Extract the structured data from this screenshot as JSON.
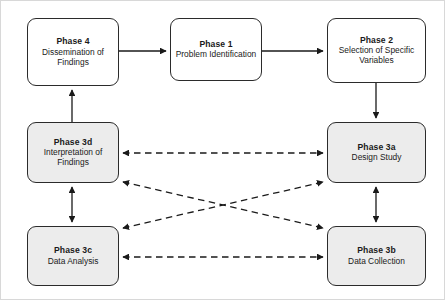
{
  "diagram": {
    "colors": {
      "plain_fill": "#ffffff",
      "shaded_fill": "#ececec",
      "stroke": "#2b2b2b",
      "frame": "#d8d8d8",
      "text": "#1a1a1a"
    },
    "nodes": [
      {
        "id": "phase4",
        "title": "Phase 4",
        "desc": "Dissemination of Findings",
        "style": "plain",
        "x": 27,
        "y": 18,
        "w": 92,
        "h": 68
      },
      {
        "id": "phase1",
        "title": "Phase 1",
        "desc": "Problem Identification",
        "style": "plain",
        "x": 170,
        "y": 18,
        "w": 92,
        "h": 63
      },
      {
        "id": "phase2",
        "title": "Phase 2",
        "desc": "Selection of Specific Variables",
        "style": "plain",
        "x": 327,
        "y": 18,
        "w": 99,
        "h": 65
      },
      {
        "id": "phase3d",
        "title": "Phase 3d",
        "desc": "Interpretation of Findings",
        "style": "shaded",
        "x": 27,
        "y": 122,
        "w": 92,
        "h": 61
      },
      {
        "id": "phase3a",
        "title": "Phase 3a",
        "desc": "Design Study",
        "style": "shaded",
        "x": 327,
        "y": 122,
        "w": 99,
        "h": 61
      },
      {
        "id": "phase3c",
        "title": "Phase 3c",
        "desc": "Data Analysis",
        "style": "shaded",
        "x": 27,
        "y": 226,
        "w": 92,
        "h": 60
      },
      {
        "id": "phase3b",
        "title": "Phase 3b",
        "desc": "Data Collection",
        "style": "shaded",
        "x": 327,
        "y": 226,
        "w": 99,
        "h": 60
      }
    ],
    "connectors": [
      {
        "id": "phase4-to-phase1",
        "from": "phase4",
        "to": "phase1",
        "style": "solid",
        "heads": "single"
      },
      {
        "id": "phase1-to-phase2",
        "from": "phase1",
        "to": "phase2",
        "style": "solid",
        "heads": "single"
      },
      {
        "id": "phase2-to-phase3a",
        "from": "phase2",
        "to": "phase3a",
        "style": "solid",
        "heads": "single"
      },
      {
        "id": "phase3d-to-phase4",
        "from": "phase3d",
        "to": "phase4",
        "style": "solid",
        "heads": "single"
      },
      {
        "id": "phase3d-phase3c",
        "from": "phase3d",
        "to": "phase3c",
        "style": "solid",
        "heads": "double"
      },
      {
        "id": "phase3a-phase3b",
        "from": "phase3a",
        "to": "phase3b",
        "style": "solid",
        "heads": "double"
      },
      {
        "id": "phase3d-phase3a",
        "from": "phase3d",
        "to": "phase3a",
        "style": "dashed",
        "heads": "double"
      },
      {
        "id": "phase3c-phase3b",
        "from": "phase3c",
        "to": "phase3b",
        "style": "dashed",
        "heads": "double"
      },
      {
        "id": "phase3d-phase3b",
        "from": "phase3d",
        "to": "phase3b",
        "style": "dashed",
        "heads": "double"
      },
      {
        "id": "phase3c-phase3a",
        "from": "phase3c",
        "to": "phase3a",
        "style": "dashed",
        "heads": "double"
      }
    ]
  }
}
